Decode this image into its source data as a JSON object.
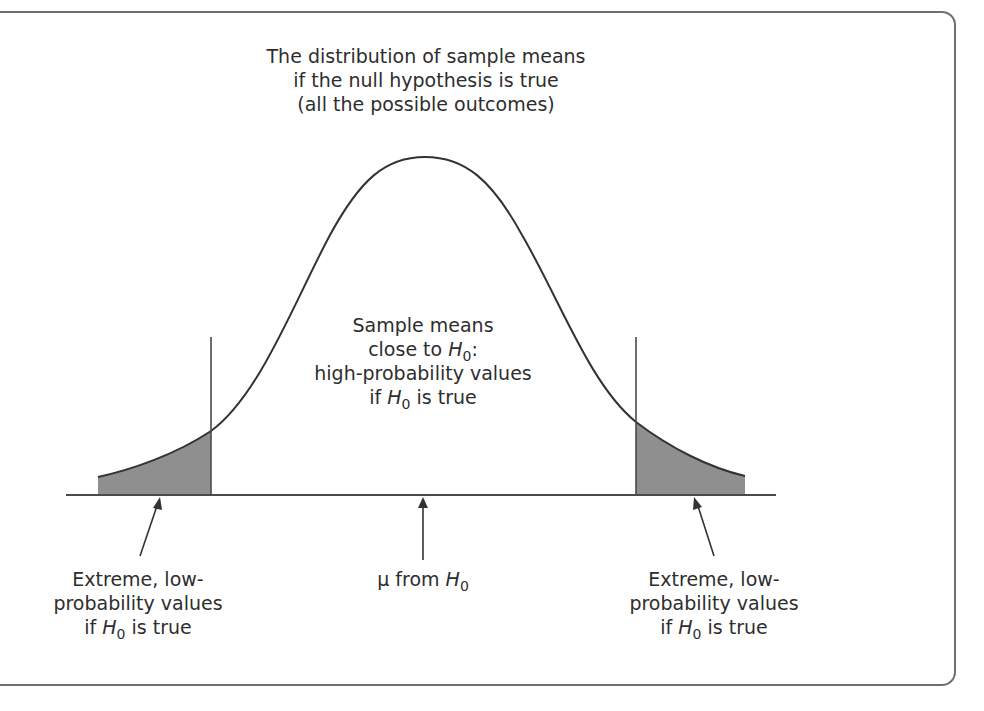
{
  "figure": {
    "title_lines": [
      "The distribution of sample means",
      "if the null hypothesis is true",
      "(all the possible outcomes)"
    ],
    "center_label": {
      "line1": "Sample means",
      "line2_prefix": "close to ",
      "line2_symbol": "H",
      "line2_subscript": "0",
      "line2_suffix": ":",
      "line3": "high-probability values",
      "line4_prefix": "if ",
      "line4_symbol": "H",
      "line4_subscript": "0",
      "line4_suffix": " is true"
    },
    "left_tail_label": {
      "line1": "Extreme, low-",
      "line2": "probability values",
      "line3_prefix": "if ",
      "line3_symbol": "H",
      "line3_subscript": "0",
      "line3_suffix": " is true"
    },
    "mean_label": {
      "prefix": "μ from ",
      "symbol": "H",
      "subscript": "0"
    },
    "right_tail_label": {
      "line1": "Extreme, low-",
      "line2": "probability values",
      "line3_prefix": "if ",
      "line3_symbol": "H",
      "line3_subscript": "0",
      "line3_suffix": " is true"
    },
    "colors": {
      "curve": "#333333",
      "tail_fill": "#8f8f8f",
      "frame": "#6f6f6f",
      "text": "#2e2e2e"
    }
  }
}
